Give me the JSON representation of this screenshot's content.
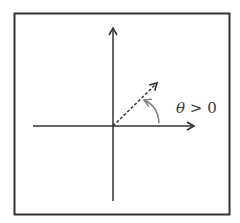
{
  "diagram": {
    "title": "",
    "frame": true,
    "axes": {
      "horizontal": {
        "direction": "right",
        "arrow": true
      },
      "vertical": {
        "direction": "up",
        "arrow": true
      }
    },
    "vector": {
      "style": "dashed",
      "angle_deg": 40,
      "arrow": true
    },
    "angle_arc": {
      "direction": "counterclockwise",
      "arrow": true
    },
    "label": {
      "symbol": "θ",
      "relation": " > 0",
      "text": "θ > 0"
    },
    "colors": {
      "stroke": "#333333",
      "background": "#ffffff",
      "arc": "#888888"
    }
  }
}
